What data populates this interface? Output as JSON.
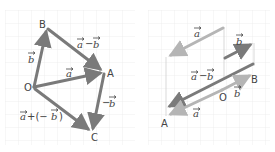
{
  "left_diagram": {
    "points": {
      "O": {
        "label": "O",
        "x": 34,
        "y": 87
      },
      "A": {
        "label": "A",
        "x": 104,
        "y": 72
      },
      "B": {
        "label": "B",
        "x": 47,
        "y": 28
      },
      "C": {
        "label": "C",
        "x": 92,
        "y": 133
      }
    },
    "vectors": [
      {
        "name": "a",
        "label": "a",
        "from": "O",
        "to": "A"
      },
      {
        "name": "b",
        "label": "b",
        "from": "O",
        "to": "B"
      },
      {
        "name": "a-minus-b",
        "label": "a − b",
        "from": "B",
        "to": "A"
      },
      {
        "name": "neg-b",
        "label": "−b",
        "from": "A",
        "to": "C"
      },
      {
        "name": "a-plus-neg-b",
        "label": "a + (−b)",
        "from": "O",
        "to": "C"
      }
    ],
    "labels": {
      "a": "a",
      "b": "b",
      "a_minus_b_1": "a",
      "a_minus_b_op": "−",
      "a_minus_b_2": "b",
      "neg_b_op": "−",
      "neg_b": "b",
      "sum_a": "a",
      "sum_op": "+(−",
      "sum_b": "b",
      "sum_close": ")"
    }
  },
  "right_diagram": {
    "points": {
      "O": {
        "label": "O",
        "x": 222,
        "y": 95
      },
      "A": {
        "label": "A",
        "x": 165,
        "y": 122
      },
      "B": {
        "label": "B",
        "x": 254,
        "y": 78
      }
    },
    "labels": {
      "top_a": "a",
      "b_dark": "b",
      "a_minus_b_1": "a",
      "a_minus_b_op": "−",
      "a_minus_b_2": "b",
      "ob_b": "b",
      "oa_a": "a"
    }
  },
  "colors": {
    "grid": "#ececec",
    "dark_arrow": "#7a7a7a",
    "light_arrow": "#b5b5b5",
    "text": "#444444",
    "guide": "#cfcfcf"
  }
}
